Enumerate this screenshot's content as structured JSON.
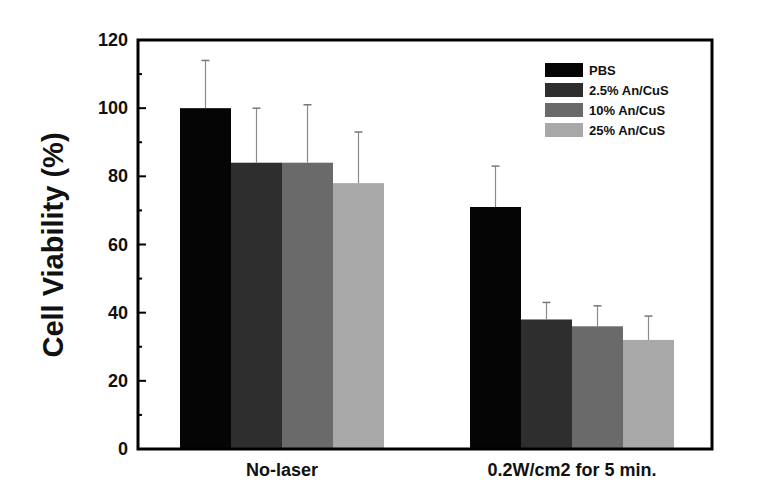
{
  "chart_data": {
    "type": "bar",
    "title": "",
    "xlabel": "",
    "ylabel": "Cell Viability (%)",
    "ylim": [
      0,
      120
    ],
    "yticks": [
      0,
      20,
      40,
      60,
      80,
      100,
      120
    ],
    "grid": false,
    "legend_position": "upper right",
    "categories": [
      "No-laser",
      "0.2W/cm2 for 5 min."
    ],
    "series": [
      {
        "name": "PBS",
        "color": "#050505",
        "values": [
          100,
          71
        ],
        "error_upper": [
          114,
          83
        ]
      },
      {
        "name": "2.5% An/CuS",
        "color": "#2e2e2e",
        "values": [
          84,
          38
        ],
        "error_upper": [
          100,
          43
        ]
      },
      {
        "name": "10% An/CuS",
        "color": "#6a6a6a",
        "values": [
          84,
          36
        ],
        "error_upper": [
          101,
          42
        ]
      },
      {
        "name": "25% An/CuS",
        "color": "#a8a8a8",
        "values": [
          78,
          32
        ],
        "error_upper": [
          93,
          39
        ]
      }
    ]
  }
}
